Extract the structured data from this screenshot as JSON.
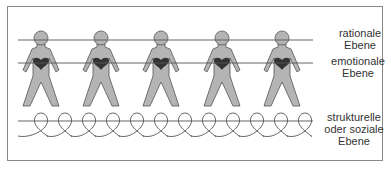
{
  "diagram": {
    "figure_count": 5,
    "figure_x": [
      41,
      101,
      161,
      222,
      282
    ],
    "colors": {
      "figure_fill": "#b4b4b4",
      "figure_stroke": "#555555",
      "heart": "#333333",
      "line": "#555555"
    },
    "levels": [
      {
        "id": "rational",
        "label": "rationale\nEbene",
        "y": 40
      },
      {
        "id": "emotional",
        "label": "emotionale\nEbene",
        "y": 63
      },
      {
        "id": "structural",
        "label": "strukturelle\noder soziale\nEbene",
        "y": 121
      }
    ]
  }
}
